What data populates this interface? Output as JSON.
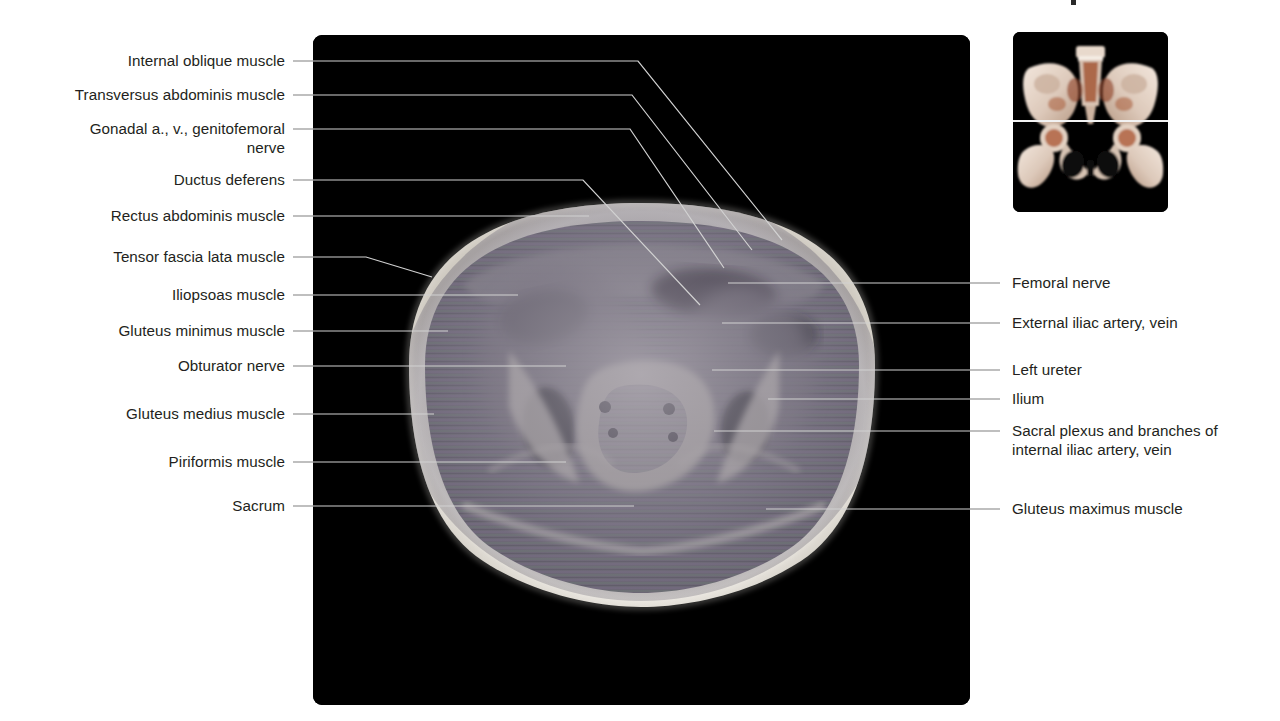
{
  "figure": {
    "kind": "axial-mri-pelvis-labeled-plate",
    "background_color": "#ffffff",
    "text_color": "#231f20",
    "leader_line_color_on_white": "#8a8a8a",
    "leader_line_color_on_black": "#d9d9d9"
  },
  "mri": {
    "alt": "Axial T1 MRI section through the male pelvis at the level of the sacrum and hip joints",
    "panel_background": "#000000",
    "fat_rim_color": "#e9e7e2",
    "muscle_color": "#6f6a78",
    "bone_marrow_color": "#cfcabf",
    "dark_void_color": "#14121a",
    "scanline_tint_a": "#7e6f8c",
    "scanline_tint_b": "#6f8476"
  },
  "inset": {
    "alt": "Three-dimensional volume rendering of the bony pelvis seen from the front with a horizontal reference line marking the level of the axial section",
    "panel_background": "#000000",
    "bone_color": "#e6d9cf",
    "bone_shadow_color": "#b9a293",
    "marrow_color": "#9c4a2c",
    "reference_line_color": "#f2f2f2"
  },
  "labels_left": [
    {
      "text": "Internal oblique muscle",
      "y": 61
    },
    {
      "text": "Transversus abdominis muscle",
      "y": 95
    },
    {
      "text": "Gonadal a., v., genitofemoral\nnerve",
      "y": 129
    },
    {
      "text": "Ductus deferens",
      "y": 180
    },
    {
      "text": "Rectus abdominis muscle",
      "y": 216
    },
    {
      "text": "Tensor fascia lata muscle",
      "y": 257
    },
    {
      "text": "Iliopsoas muscle",
      "y": 295
    },
    {
      "text": "Gluteus minimus muscle",
      "y": 331
    },
    {
      "text": "Obturator nerve",
      "y": 366
    },
    {
      "text": "Gluteus medius muscle",
      "y": 414
    },
    {
      "text": "Piriformis muscle",
      "y": 462
    },
    {
      "text": "Sacrum",
      "y": 506
    }
  ],
  "labels_right": [
    {
      "text": "Femoral nerve",
      "y": 283
    },
    {
      "text": "External iliac artery, vein",
      "y": 323
    },
    {
      "text": "Left ureter",
      "y": 370
    },
    {
      "text": "Ilium",
      "y": 399
    },
    {
      "text": "Sacral plexus and branches of\ninternal iliac artery, vein",
      "y": 431
    },
    {
      "text": "Gluteus maximus muscle",
      "y": 509
    }
  ]
}
